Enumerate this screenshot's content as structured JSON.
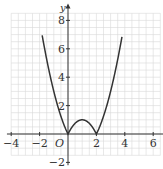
{
  "chart_data": {
    "type": "line",
    "title": "",
    "function": "y = |x^2 - 2x|",
    "xlabel": "x",
    "ylabel": "y",
    "origin_label": "O",
    "xlim": [
      -4,
      6.5
    ],
    "ylim": [
      -2,
      8.5
    ],
    "x_ticks": [
      -4,
      -2,
      2,
      4,
      6
    ],
    "y_ticks": [
      -2,
      2,
      4,
      6,
      8
    ],
    "x_tick_labels": [
      "-4",
      "-2",
      "2",
      "4",
      "6"
    ],
    "y_tick_labels": [
      "-2",
      "2",
      "4",
      "6",
      "8"
    ],
    "grid": true,
    "grid_minor_step": 0.5,
    "series": [
      {
        "name": "y = |x^2 - 2x|",
        "color": "#333333",
        "x": [
          -1.8,
          -1.5,
          -1,
          -0.5,
          0,
          0.5,
          1,
          1.5,
          2,
          2.5,
          3,
          3.5,
          3.8
        ],
        "y": [
          6.84,
          5.25,
          3,
          1.25,
          0,
          0.75,
          1,
          0.75,
          0,
          1.25,
          3,
          5.25,
          6.84
        ]
      }
    ],
    "key_points": [
      {
        "x": 0,
        "y": 0
      },
      {
        "x": 1,
        "y": 1
      },
      {
        "x": 2,
        "y": 0
      }
    ],
    "colors": {
      "curve": "#333333",
      "grid": "#d9d9d9",
      "axes": "#333333"
    }
  }
}
